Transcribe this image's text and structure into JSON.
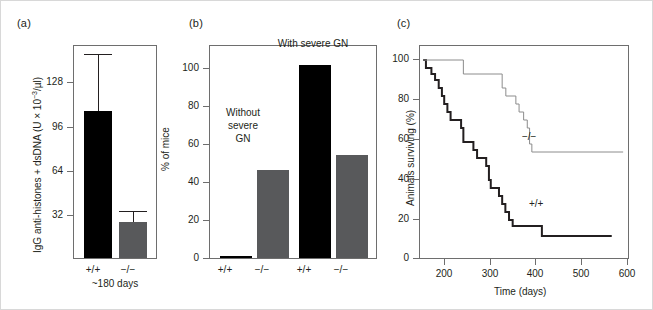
{
  "figure": {
    "panels": [
      {
        "letter": "(a)"
      },
      {
        "letter": "(b)"
      },
      {
        "letter": "(c)"
      }
    ]
  },
  "panel_a": {
    "letter": "(a)",
    "ylabel": "IgG anti-histones + dsDNA (U × 10",
    "ylabel_exp": "−3",
    "ylabel_tail": "/µl)",
    "yticks": [
      "32",
      "64",
      "96",
      "128"
    ],
    "categories": [
      "+/+",
      "−/−"
    ],
    "subcaption": "~180 days"
  },
  "panel_b": {
    "letter": "(b)",
    "ylabel": "% of mice",
    "yticks": [
      "0",
      "20",
      "40",
      "60",
      "80",
      "100"
    ],
    "categories": [
      "+/+",
      "−/−",
      "+/+",
      "−/−"
    ],
    "annotation_without": "Without\nsevere\nGN",
    "annotation_with": "With severe GN"
  },
  "panel_c": {
    "letter": "(c)",
    "ylabel": "Animals surviving (%)",
    "xlabel": "Time (days)",
    "yticks": [
      "0",
      "20",
      "40",
      "60",
      "80",
      "100"
    ],
    "xticks": [
      "200",
      "300",
      "400",
      "500",
      "600"
    ],
    "curve_labels": {
      "ko": "−/−",
      "wt": "+/+"
    }
  },
  "chart_data": [
    {
      "type": "bar",
      "panel": "a",
      "title": "",
      "xlabel": "~180 days",
      "ylabel": "IgG anti-histones + dsDNA (U × 10-3/µl)",
      "categories": [
        "+/+",
        "-/-"
      ],
      "values": [
        107,
        26
      ],
      "errors_upper": [
        148,
        34
      ],
      "colors": [
        "#000000",
        "#58595b"
      ],
      "ylim": [
        0,
        155
      ],
      "yticks": [
        32,
        64,
        96,
        128
      ],
      "grid": false,
      "legend": "none"
    },
    {
      "type": "bar",
      "panel": "b",
      "title": "",
      "xlabel": "",
      "ylabel": "% of mice",
      "categories": [
        "+/+",
        "-/-",
        "+/+",
        "-/-"
      ],
      "values": [
        1,
        46,
        101,
        54
      ],
      "group_labels": [
        "Without severe GN",
        "Without severe GN",
        "With severe GN",
        "With severe GN"
      ],
      "colors": [
        "#000000",
        "#58595b",
        "#000000",
        "#58595b"
      ],
      "ylim": [
        0,
        112
      ],
      "yticks": [
        0,
        20,
        40,
        60,
        80,
        100
      ],
      "grid": false,
      "legend": "none"
    },
    {
      "type": "line",
      "subtype": "kaplan-meier-step",
      "panel": "c",
      "title": "",
      "xlabel": "Time (days)",
      "ylabel": "Animals surviving (%)",
      "xlim": [
        145,
        605
      ],
      "ylim": [
        0,
        107
      ],
      "xticks": [
        200,
        300,
        400,
        500,
        600
      ],
      "yticks": [
        0,
        20,
        40,
        60,
        80,
        100
      ],
      "grid": false,
      "legend": "inline-annotations",
      "series": [
        {
          "name": "+/+",
          "color": "#231f20",
          "width": 2,
          "points": [
            [
              152,
              100
            ],
            [
              158,
              96
            ],
            [
              170,
              93
            ],
            [
              178,
              90
            ],
            [
              186,
              86
            ],
            [
              193,
              82
            ],
            [
              198,
              78
            ],
            [
              205,
              74
            ],
            [
              212,
              70
            ],
            [
              235,
              66
            ],
            [
              240,
              59
            ],
            [
              262,
              55
            ],
            [
              270,
              51
            ],
            [
              290,
              47
            ],
            [
              296,
              40
            ],
            [
              300,
              36
            ],
            [
              318,
              32
            ],
            [
              325,
              28
            ],
            [
              332,
              24
            ],
            [
              340,
              20
            ],
            [
              348,
              17
            ],
            [
              408,
              17
            ],
            [
              412,
              12
            ],
            [
              565,
              12
            ]
          ]
        },
        {
          "name": "-/-",
          "color": "#8c8c8c",
          "width": 1,
          "points": [
            [
              152,
              100
            ],
            [
              235,
              100
            ],
            [
              240,
              93
            ],
            [
              318,
              93
            ],
            [
              325,
              86
            ],
            [
              333,
              82
            ],
            [
              355,
              78
            ],
            [
              362,
              74
            ],
            [
              372,
              70
            ],
            [
              380,
              66
            ],
            [
              385,
              58
            ],
            [
              390,
              54
            ],
            [
              590,
              54
            ]
          ]
        }
      ]
    }
  ]
}
